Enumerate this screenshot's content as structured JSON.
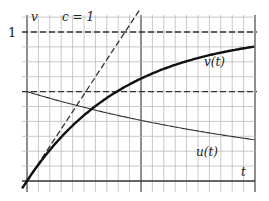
{
  "chart_data": {
    "type": "line",
    "title": "",
    "xlabel": "t",
    "ylabel": "v",
    "annotation": "c = 1",
    "ytick_labels": [
      "1"
    ],
    "xlim": [
      0,
      2.3
    ],
    "ylim": [
      0,
      1.1
    ],
    "grid": true,
    "reference_lines": [
      {
        "name": "v = 1",
        "style": "dashed",
        "y": 1
      },
      {
        "name": "u(0) level",
        "style": "dashed",
        "y": 0.6
      },
      {
        "name": "tangent v = t",
        "style": "dashed",
        "slope": 1
      }
    ],
    "series": [
      {
        "name": "v(t)",
        "style": "thick",
        "x": [
          0,
          0.25,
          0.5,
          0.75,
          1.0,
          1.25,
          1.5,
          1.75,
          2.0,
          2.3
        ],
        "values": [
          0,
          0.22,
          0.39,
          0.53,
          0.63,
          0.71,
          0.78,
          0.83,
          0.86,
          0.9
        ]
      },
      {
        "name": "u(t)",
        "style": "thin",
        "x": [
          0,
          0.25,
          0.5,
          0.75,
          1.0,
          1.25,
          1.5,
          1.75,
          2.0,
          2.3
        ],
        "values": [
          0.6,
          0.55,
          0.51,
          0.47,
          0.43,
          0.4,
          0.36,
          0.34,
          0.31,
          0.28
        ]
      }
    ]
  },
  "labels": {
    "y_axis": "v",
    "x_axis": "t",
    "param": "c = 1",
    "one": "1",
    "v_curve": "v(t)",
    "u_curve": "u(t)"
  }
}
